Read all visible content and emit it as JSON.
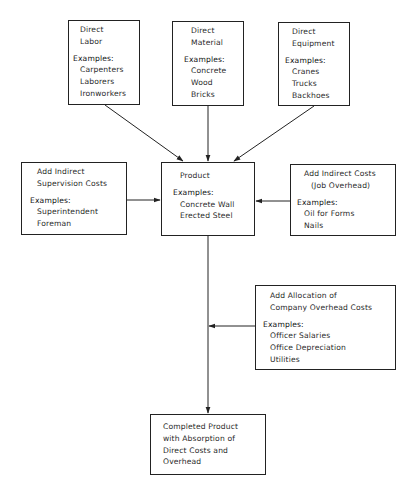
{
  "diagram": {
    "type": "flow",
    "boxes": {
      "direct_labor": {
        "title": [
          "Direct",
          "Labor"
        ],
        "examples_label": "Examples:",
        "examples": [
          "Carpenters",
          "Laborers",
          "Ironworkers"
        ]
      },
      "direct_material": {
        "title": [
          "Direct",
          "Material"
        ],
        "examples_label": "Examples:",
        "examples": [
          "Concrete",
          "Wood",
          "Bricks"
        ]
      },
      "direct_equipment": {
        "title": [
          "Direct",
          "Equipment"
        ],
        "examples_label": "Examples:",
        "examples": [
          "Cranes",
          "Trucks",
          "Backhoes"
        ]
      },
      "indirect_supervision": {
        "title": [
          "Add Indirect",
          "Supervision Costs"
        ],
        "examples_label": "Examples:",
        "examples": [
          "Superintendent",
          "Foreman"
        ]
      },
      "product": {
        "title": [
          "Product"
        ],
        "examples_label": "Examples:",
        "examples": [
          "Concrete Wall",
          "Erected Steel"
        ]
      },
      "indirect_job_overhead": {
        "title": [
          "Add Indirect Costs",
          "(Job Overhead)"
        ],
        "examples_label": "Examples:",
        "examples": [
          "Oil for Forms",
          "Nails"
        ]
      },
      "company_overhead": {
        "title": [
          "Add Allocation of",
          "Company Overhead Costs"
        ],
        "examples_label": "Examples:",
        "examples": [
          "Officer Salaries",
          "Office Depreciation",
          "Utilities"
        ]
      },
      "completed_product": {
        "title": [
          "Completed Product",
          "with Absorption of",
          "Direct Costs and",
          "Overhead"
        ]
      }
    },
    "edges": [
      {
        "from": "direct_labor",
        "to": "product"
      },
      {
        "from": "direct_material",
        "to": "product"
      },
      {
        "from": "direct_equipment",
        "to": "product"
      },
      {
        "from": "indirect_supervision",
        "to": "product"
      },
      {
        "from": "indirect_job_overhead",
        "to": "product"
      },
      {
        "from": "product",
        "to": "completed_product"
      },
      {
        "from": "company_overhead",
        "to": "product-to-completed-line"
      }
    ],
    "colors": {
      "line": "#222222",
      "text": "#2a2a2a",
      "background": "#ffffff"
    }
  }
}
